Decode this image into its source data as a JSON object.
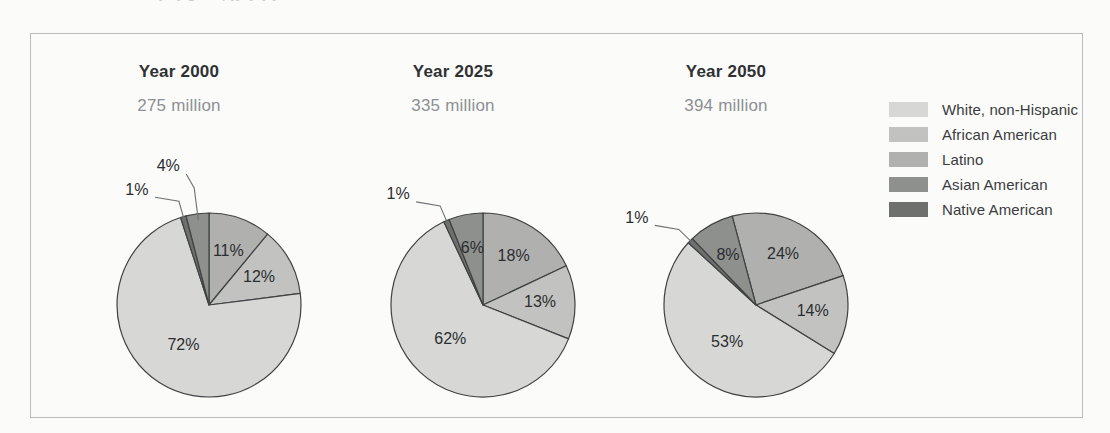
{
  "frame": {
    "border_color": "#b9bcc0",
    "background": "#fbfbfa"
  },
  "ghost_caption": "ajnlj g ... pjy y j y",
  "legend": {
    "title": "",
    "items": [
      {
        "label": "White, non-Hispanic",
        "color": "#d7d8d6"
      },
      {
        "label": "African American",
        "color": "#c2c3c1"
      },
      {
        "label": "Latino",
        "color": "#b0b1af"
      },
      {
        "label": "Asian American",
        "color": "#8e908e"
      },
      {
        "label": "Native American",
        "color": "#6e706e"
      }
    ]
  },
  "chart_data": {
    "type": "pie",
    "title": "",
    "legend_position": "right",
    "categories": [
      "White, non-Hispanic",
      "African American",
      "Latino",
      "Asian American",
      "Native American"
    ],
    "colors": [
      "#d7d8d6",
      "#c2c3c1",
      "#b0b1af",
      "#8e908e",
      "#6e706e"
    ],
    "charts": [
      {
        "title": "Year 2000",
        "subtitle": "275 million",
        "start_angle": 0,
        "values": [
          72,
          12,
          11,
          4,
          1
        ],
        "labels": [
          "72%",
          "12%",
          "11%",
          "4%",
          "1%"
        ],
        "callout": [
          "4%",
          "1%"
        ]
      },
      {
        "title": "Year 2025",
        "subtitle": "335 million",
        "start_angle": 0,
        "values": [
          62,
          13,
          18,
          6,
          1
        ],
        "labels": [
          "62%",
          "13%",
          "18%",
          "6%",
          "1%"
        ],
        "callout": [
          "1%"
        ]
      },
      {
        "title": "Year 2050",
        "subtitle": "394 million",
        "start_angle": -15,
        "values": [
          53,
          14,
          24,
          8,
          1
        ],
        "labels": [
          "53%",
          "14%",
          "24%",
          "8%",
          "1%"
        ],
        "callout": [
          "1%"
        ]
      }
    ]
  }
}
